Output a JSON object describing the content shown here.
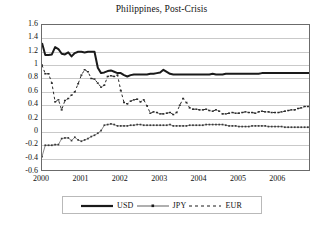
{
  "chart_data": {
    "type": "line",
    "title": "Philippines, Post-Crisis",
    "xlabel": "",
    "ylabel": "",
    "ylim": [
      -0.6,
      1.6
    ],
    "ytick_step": 0.2,
    "yticks": [
      "1.6",
      "1.4",
      "1.2",
      "1",
      "0.8",
      "0.6",
      "0.4",
      "0.2",
      "0",
      "-0.2",
      "-0.4",
      "-0.6"
    ],
    "ytick_values": [
      1.6,
      1.4,
      1.2,
      1.0,
      0.8,
      0.6,
      0.4,
      0.2,
      0,
      -0.2,
      -0.4,
      -0.6
    ],
    "xticks": [
      "2000",
      "2001",
      "2002",
      "2003",
      "2004",
      "2005",
      "2006"
    ],
    "xtick_values": [
      2000,
      2001,
      2002,
      2003,
      2004,
      2005,
      2006
    ],
    "xlim": [
      2000.0,
      2006.83
    ],
    "grid": true,
    "grid_axis": "y",
    "legend_position": "bottom",
    "x": [
      2000.0,
      2000.083,
      2000.167,
      2000.25,
      2000.333,
      2000.417,
      2000.5,
      2000.583,
      2000.667,
      2000.75,
      2000.833,
      2000.917,
      2001.0,
      2001.083,
      2001.167,
      2001.25,
      2001.333,
      2001.417,
      2001.5,
      2001.583,
      2001.667,
      2001.75,
      2001.833,
      2001.917,
      2002.0,
      2002.083,
      2002.167,
      2002.25,
      2002.333,
      2002.417,
      2002.5,
      2002.583,
      2002.667,
      2002.75,
      2002.833,
      2002.917,
      2003.0,
      2003.083,
      2003.167,
      2003.25,
      2003.333,
      2003.417,
      2003.5,
      2003.583,
      2003.667,
      2003.75,
      2003.833,
      2003.917,
      2004.0,
      2004.083,
      2004.167,
      2004.25,
      2004.333,
      2004.417,
      2004.5,
      2004.583,
      2004.667,
      2004.75,
      2004.833,
      2004.917,
      2005.0,
      2005.083,
      2005.167,
      2005.25,
      2005.333,
      2005.417,
      2005.5,
      2005.583,
      2005.667,
      2005.75,
      2005.833,
      2005.917,
      2006.0,
      2006.083,
      2006.167,
      2006.25,
      2006.333,
      2006.417,
      2006.5,
      2006.583,
      2006.667,
      2006.75,
      2006.833
    ],
    "series": [
      {
        "name": "USD",
        "style": "solid",
        "color": "#1a1a1a",
        "width": 2.0,
        "marker": "none",
        "values": [
          1.33,
          1.15,
          1.15,
          1.16,
          1.27,
          1.24,
          1.17,
          1.16,
          1.19,
          1.13,
          1.18,
          1.2,
          1.2,
          1.19,
          1.2,
          1.2,
          1.2,
          0.96,
          0.88,
          0.89,
          0.91,
          0.92,
          0.9,
          0.88,
          0.88,
          0.85,
          0.83,
          0.85,
          0.86,
          0.86,
          0.86,
          0.86,
          0.86,
          0.87,
          0.87,
          0.88,
          0.89,
          0.93,
          0.9,
          0.87,
          0.86,
          0.86,
          0.86,
          0.86,
          0.86,
          0.86,
          0.86,
          0.86,
          0.86,
          0.86,
          0.86,
          0.86,
          0.87,
          0.86,
          0.86,
          0.86,
          0.87,
          0.87,
          0.87,
          0.87,
          0.87,
          0.87,
          0.87,
          0.87,
          0.87,
          0.87,
          0.87,
          0.88,
          0.88,
          0.88,
          0.88,
          0.88,
          0.88,
          0.88,
          0.88,
          0.88,
          0.88,
          0.88,
          0.88,
          0.88,
          0.88,
          0.88,
          0.88
        ]
      },
      {
        "name": "JPY",
        "style": "solid-thin-marker",
        "color": "#3a3a3a",
        "width": 0.7,
        "marker": "square",
        "values": [
          -0.37,
          -0.2,
          -0.2,
          -0.2,
          -0.19,
          -0.19,
          -0.1,
          -0.09,
          -0.09,
          -0.13,
          -0.08,
          -0.12,
          -0.14,
          -0.12,
          -0.1,
          -0.07,
          -0.05,
          -0.02,
          0.02,
          0.1,
          0.11,
          0.12,
          0.11,
          0.09,
          0.09,
          0.09,
          0.09,
          0.1,
          0.1,
          0.11,
          0.11,
          0.1,
          0.1,
          0.1,
          0.1,
          0.1,
          0.1,
          0.1,
          0.1,
          0.11,
          0.09,
          0.09,
          0.09,
          0.09,
          0.09,
          0.1,
          0.1,
          0.1,
          0.1,
          0.1,
          0.11,
          0.11,
          0.11,
          0.11,
          0.11,
          0.11,
          0.1,
          0.09,
          0.09,
          0.09,
          0.08,
          0.08,
          0.08,
          0.08,
          0.09,
          0.09,
          0.09,
          0.09,
          0.09,
          0.08,
          0.08,
          0.08,
          0.08,
          0.08,
          0.07,
          0.07,
          0.07,
          0.07,
          0.07,
          0.07,
          0.07,
          0.07,
          0.07
        ]
      },
      {
        "name": "EUR",
        "style": "dashed",
        "color": "#2a2a2a",
        "width": 1.0,
        "marker": "dash",
        "values": [
          1.0,
          0.87,
          0.87,
          0.73,
          0.45,
          0.48,
          0.33,
          0.47,
          0.5,
          0.55,
          0.6,
          0.72,
          0.85,
          0.93,
          0.9,
          0.8,
          0.79,
          0.73,
          0.67,
          0.7,
          0.83,
          0.84,
          0.83,
          0.85,
          0.62,
          0.44,
          0.42,
          0.46,
          0.48,
          0.49,
          0.45,
          0.48,
          0.39,
          0.28,
          0.3,
          0.29,
          0.27,
          0.27,
          0.28,
          0.29,
          0.26,
          0.29,
          0.4,
          0.5,
          0.44,
          0.36,
          0.34,
          0.34,
          0.33,
          0.33,
          0.34,
          0.32,
          0.31,
          0.33,
          0.31,
          0.27,
          0.27,
          0.28,
          0.29,
          0.28,
          0.28,
          0.29,
          0.3,
          0.29,
          0.29,
          0.28,
          0.3,
          0.31,
          0.3,
          0.3,
          0.29,
          0.29,
          0.29,
          0.3,
          0.31,
          0.32,
          0.33,
          0.33,
          0.35,
          0.36,
          0.38,
          0.38,
          0.39
        ]
      }
    ]
  },
  "legend": {
    "items": [
      {
        "label": "USD",
        "style": "solid"
      },
      {
        "label": "JPY",
        "style": "solid-thin-marker"
      },
      {
        "label": "EUR",
        "style": "dashed"
      }
    ]
  }
}
